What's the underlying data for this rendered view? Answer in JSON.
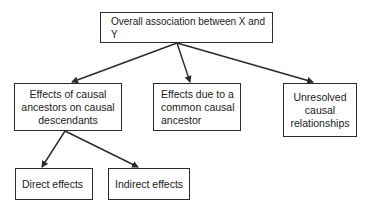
{
  "diagram": {
    "type": "tree",
    "nodes": {
      "root": {
        "label": "Overall association between X and Y"
      },
      "ancestors_on_descendants": {
        "label": "Effects of causal ancestors on causal descendants"
      },
      "common_ancestor": {
        "label": "Effects due to a common causal ancestor"
      },
      "unresolved": {
        "label": "Unresolved causal relationships"
      },
      "direct": {
        "label": "Direct effects"
      },
      "indirect": {
        "label": "Indirect effects"
      }
    },
    "edges": [
      {
        "from": "root",
        "to": "ancestors_on_descendants"
      },
      {
        "from": "root",
        "to": "common_ancestor"
      },
      {
        "from": "root",
        "to": "unresolved"
      },
      {
        "from": "ancestors_on_descendants",
        "to": "direct"
      },
      {
        "from": "ancestors_on_descendants",
        "to": "indirect"
      }
    ],
    "colors": {
      "line": "#2a2a2a",
      "text": "#222222",
      "background": "#ffffff"
    }
  }
}
